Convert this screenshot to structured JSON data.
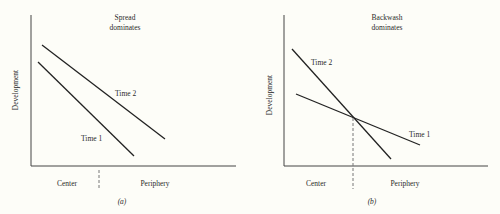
{
  "figure": {
    "panels": [
      {
        "id": "a",
        "caption": "(a)",
        "title_line1": "Spread",
        "title_line2": "dominates",
        "y_label": "Development",
        "x_label_left": "Center",
        "x_label_right": "Periphery",
        "lines": [
          {
            "label": "Time 2"
          },
          {
            "label": "Time 1"
          }
        ]
      },
      {
        "id": "b",
        "caption": "(b)",
        "title_line1": "Backwash",
        "title_line2": "dominates",
        "y_label": "Development",
        "x_label_left": "Center",
        "x_label_right": "Periphery",
        "lines": [
          {
            "label": "Time 2"
          },
          {
            "label": "Time 1"
          }
        ]
      }
    ],
    "colors": {
      "ink": "#222222",
      "dashed": "#777777",
      "background": "#fdfdf8"
    }
  }
}
